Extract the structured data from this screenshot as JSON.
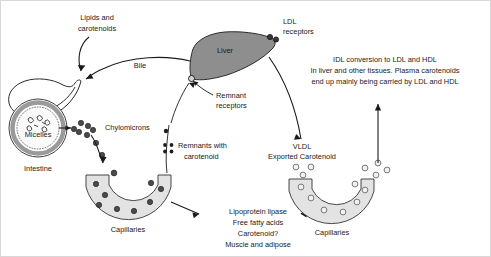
{
  "figure": {
    "background_color": "#ffffff",
    "border_color": "#d8d8d8"
  },
  "colors": {
    "liver": "#8e8e8e",
    "capillary": "#e3e3e3",
    "dark_particle": "#4a4a4a",
    "open_particle": "#f2f2f2",
    "stroke": "#1a1a1a"
  },
  "labels": {
    "lipids_and_carotenoids_line1": "Lipids and",
    "lipids_and_carotenoids_line2": "carotenoids",
    "bile": "Bile",
    "liver": "Liver",
    "ldl_receptors_line1": "LDL",
    "ldl_receptors_line2": "receptors",
    "remnant_receptors_line1": "Remnant",
    "remnant_receptors_line2": "receptors",
    "micelles": "Micelles",
    "intestine": "Intestine",
    "chylomicrons": "Chylomicrons",
    "remnants_line1": "Remnants with",
    "remnants_line2": "carotenoid",
    "capillaries_left": "Capillaries",
    "capillaries_right": "Capillaries",
    "vldl": "VLDL",
    "exported_carotenoid": "Exported Carotenoid",
    "idl_note_line1": "IDL conversion to LDL and HDL",
    "idl_note_line2": "In liver and other tissues. Plasma carotenoids",
    "idl_note_line3": "end up mainly being carried by LDL and HDL",
    "tissue_note_line1": "Lipoprotein lipase",
    "tissue_note_line2": "Free fatty acids",
    "tissue_note_line3": "Carotenoid?",
    "tissue_note_line4": "Muscle and adipose"
  },
  "particles": {
    "chylomicron_chain": [
      {
        "x": 78,
        "y": 129,
        "r": 2.6
      },
      {
        "x": 85,
        "y": 125,
        "r": 2.6
      },
      {
        "x": 73,
        "y": 134,
        "r": 2.6
      },
      {
        "x": 81,
        "y": 134,
        "r": 2.6
      },
      {
        "x": 89,
        "y": 131,
        "r": 2.6
      },
      {
        "x": 93,
        "y": 139,
        "r": 2.6
      },
      {
        "x": 95,
        "y": 148,
        "r": 2.6
      },
      {
        "x": 104,
        "y": 157,
        "r": 2.6
      },
      {
        "x": 112,
        "y": 170,
        "r": 2.6
      }
    ],
    "left_capillary_dots": [
      {
        "x": 95,
        "y": 180,
        "r": 2.6
      },
      {
        "x": 108,
        "y": 191,
        "r": 2.6
      },
      {
        "x": 101,
        "y": 202,
        "r": 2.6
      },
      {
        "x": 118,
        "y": 205,
        "r": 2.6
      },
      {
        "x": 134,
        "y": 207,
        "r": 2.6
      },
      {
        "x": 148,
        "y": 196,
        "r": 2.6
      },
      {
        "x": 154,
        "y": 184,
        "r": 2.6
      },
      {
        "x": 144,
        "y": 188,
        "r": 2.6
      }
    ],
    "remnant_cluster": [
      {
        "x": 164,
        "y": 145,
        "r": 1.9
      },
      {
        "x": 170,
        "y": 145,
        "r": 1.9
      },
      {
        "x": 164,
        "y": 151,
        "r": 1.9
      },
      {
        "x": 170,
        "y": 151,
        "r": 1.9
      },
      {
        "x": 165,
        "y": 131,
        "r": 2.2
      }
    ],
    "vldl_exported_dots": [
      {
        "x": 299,
        "y": 163,
        "r": 2.8
      },
      {
        "x": 313,
        "y": 163,
        "r": 2.8
      },
      {
        "x": 305,
        "y": 172,
        "r": 2.8
      }
    ],
    "right_capillary_dots": [
      {
        "x": 311,
        "y": 185,
        "r": 2.8
      },
      {
        "x": 322,
        "y": 196,
        "r": 2.8
      },
      {
        "x": 338,
        "y": 208,
        "r": 2.8
      },
      {
        "x": 355,
        "y": 202,
        "r": 2.8
      },
      {
        "x": 362,
        "y": 190,
        "r": 2.8
      },
      {
        "x": 368,
        "y": 180,
        "r": 2.8
      }
    ],
    "right_outside_dots": [
      {
        "x": 365,
        "y": 166,
        "r": 2.8
      },
      {
        "x": 376,
        "y": 161,
        "r": 2.8
      },
      {
        "x": 384,
        "y": 167,
        "r": 2.8
      },
      {
        "x": 374,
        "y": 172,
        "r": 2.8
      }
    ]
  },
  "receptors": {
    "ldl": [
      {
        "x": 269,
        "y": 36,
        "r": 2.6
      },
      {
        "x": 275,
        "y": 38,
        "r": 2.6
      }
    ],
    "remnant": [
      {
        "x": 190,
        "y": 78,
        "r": 3.0
      }
    ]
  }
}
